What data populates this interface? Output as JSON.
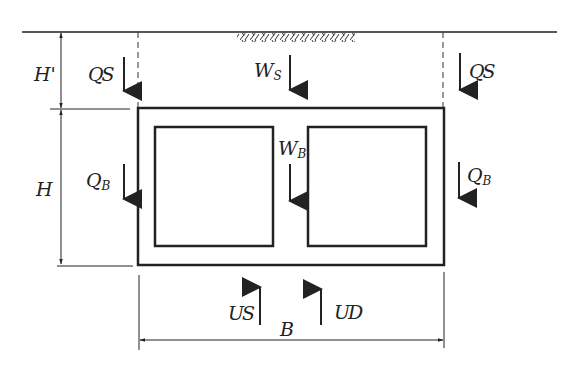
{
  "diagram": {
    "title": "",
    "colors": {
      "stroke": "#222222",
      "background": "#ffffff"
    },
    "dimensions": {
      "cover_depth": {
        "symbol": "H",
        "prime": "'"
      },
      "box_height": {
        "symbol": "H"
      },
      "box_width": {
        "symbol": "B"
      }
    },
    "loads": {
      "soil_weight": {
        "symbol": "W",
        "subscript": "S",
        "direction": "down"
      },
      "box_weight": {
        "symbol": "W",
        "subscript": "B",
        "direction": "down"
      },
      "side_friction_soil_left": {
        "symbol": "Q",
        "subscript": "S",
        "direction": "down"
      },
      "side_friction_soil_right": {
        "symbol": "Q",
        "subscript": "S",
        "direction": "down"
      },
      "side_friction_box_left": {
        "symbol": "Q",
        "subscript": "B",
        "direction": "down"
      },
      "side_friction_box_right": {
        "symbol": "Q",
        "subscript": "B",
        "direction": "down"
      },
      "uplift_static": {
        "symbol": "U",
        "subscript": "S",
        "direction": "up"
      },
      "uplift_dynamic": {
        "symbol": "U",
        "subscript": "D",
        "direction": "up"
      }
    },
    "cells": 2
  }
}
